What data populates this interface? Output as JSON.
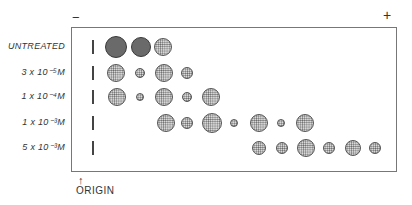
{
  "figure": {
    "pole_negative": "−",
    "pole_positive": "+",
    "origin_label": "ORIGIN",
    "origin_arrow": "↑",
    "rows": [
      {
        "label": "UNTREATED",
        "y": 47,
        "spots": [
          {
            "x": 116,
            "r": 11,
            "dark": true
          },
          {
            "x": 141,
            "r": 10,
            "dark": true
          },
          {
            "x": 163,
            "r": 9,
            "dark": false
          }
        ]
      },
      {
        "label": "3 x 10⁻⁵M",
        "y": 73,
        "spots": [
          {
            "x": 116,
            "r": 9,
            "dark": false
          },
          {
            "x": 140,
            "r": 5,
            "dark": false
          },
          {
            "x": 164,
            "r": 9,
            "dark": false
          },
          {
            "x": 187,
            "r": 6,
            "dark": false
          }
        ]
      },
      {
        "label": "1 x 10⁻⁴M",
        "y": 97,
        "spots": [
          {
            "x": 117,
            "r": 9,
            "dark": false
          },
          {
            "x": 140,
            "r": 4,
            "dark": false
          },
          {
            "x": 164,
            "r": 9,
            "dark": false
          },
          {
            "x": 187,
            "r": 5,
            "dark": false
          },
          {
            "x": 211,
            "r": 9,
            "dark": false
          }
        ]
      },
      {
        "label": "1 x 10⁻³M",
        "y": 123,
        "spots": [
          {
            "x": 166,
            "r": 9,
            "dark": false
          },
          {
            "x": 187,
            "r": 6,
            "dark": false
          },
          {
            "x": 212,
            "r": 10,
            "dark": false
          },
          {
            "x": 234,
            "r": 4,
            "dark": false
          },
          {
            "x": 259,
            "r": 9,
            "dark": false
          },
          {
            "x": 281,
            "r": 4,
            "dark": false
          },
          {
            "x": 305,
            "r": 9,
            "dark": false
          }
        ]
      },
      {
        "label": "5 x 10⁻³M",
        "y": 148,
        "spots": [
          {
            "x": 259,
            "r": 7,
            "dark": false
          },
          {
            "x": 282,
            "r": 6,
            "dark": false
          },
          {
            "x": 306,
            "r": 9,
            "dark": false
          },
          {
            "x": 329,
            "r": 6,
            "dark": false
          },
          {
            "x": 353,
            "r": 8,
            "dark": false
          },
          {
            "x": 375,
            "r": 6,
            "dark": false
          }
        ]
      }
    ]
  }
}
